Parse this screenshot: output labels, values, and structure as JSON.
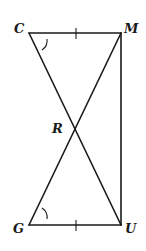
{
  "diagram": {
    "type": "geometry-figure",
    "points": {
      "C": {
        "label": "C",
        "x": 29,
        "y": 33
      },
      "M": {
        "label": "M",
        "x": 121,
        "y": 33
      },
      "R": {
        "label": "R",
        "x": 76,
        "y": 129
      },
      "G": {
        "label": "G",
        "x": 29,
        "y": 225
      },
      "U": {
        "label": "U",
        "x": 121,
        "y": 225
      }
    },
    "segments": [
      "CM",
      "CU",
      "MG",
      "MU",
      "GU"
    ],
    "markings": {
      "congruent_sides": [
        "CM",
        "GU"
      ],
      "congruent_angles": [
        "angle C",
        "angle G"
      ]
    },
    "labels": {
      "C": "C",
      "M": "M",
      "R": "R",
      "G": "G",
      "U": "U"
    },
    "colors": {
      "stroke": "#1a1a1a",
      "background": "#ffffff"
    }
  }
}
